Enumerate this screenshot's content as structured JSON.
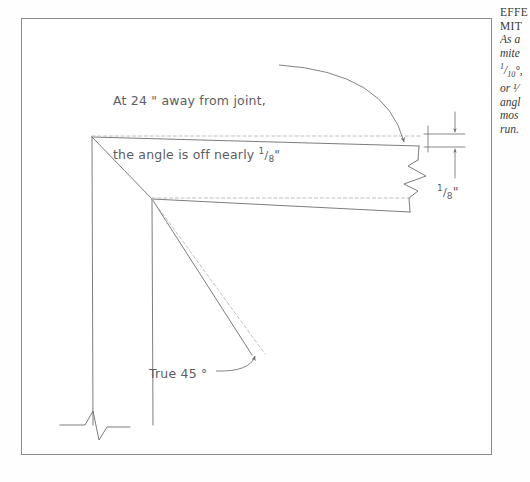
{
  "page": {
    "background_color": "#fefefe",
    "frame_color": "#8a8a8a"
  },
  "diagram": {
    "title_semantic": "miter-angle-error-drawing",
    "ink_color": "#6d6d72",
    "dash_color": "#b9b9be",
    "annotations": {
      "note_line1": "At 24 \" away from joint,",
      "note_line2_pre": "the angle is off nearly ",
      "note_line2_frac_num": "1",
      "note_line2_frac_den": "8",
      "note_line2_post": "\"",
      "true_angle_label": "True 45 °",
      "dimension_frac_num": "1",
      "dimension_frac_den": "8",
      "dimension_post": "\""
    },
    "elements": {
      "break_symbol_right": "break-symbol",
      "break_symbol_bottom": "break-symbol",
      "leader_arrow_joint": "curved-leader-arrow",
      "leader_arrow_angle": "curved-leader-arrow",
      "dimension_arrows": "dimension-arrow-pair",
      "reference_line_style": "dashed",
      "actual_line_style": "solid"
    }
  },
  "caption": {
    "heading_line1": "EFFE",
    "heading_line2": "MIT",
    "body_line1": "As a",
    "body_line2": "mite",
    "body_line3_pre": "",
    "body_line3_num": "1",
    "body_line3_den": "10",
    "body_line3_post": "°,",
    "body_line4": "or ¹⁄",
    "body_line5": "angl",
    "body_line6": "mos",
    "body_line7": "run."
  }
}
